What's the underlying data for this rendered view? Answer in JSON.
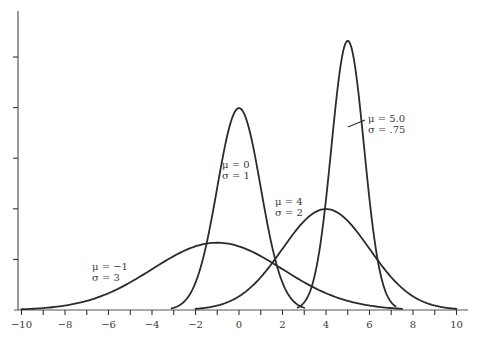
{
  "chart_data": {
    "type": "line",
    "title": "",
    "xlabel": "",
    "ylabel": "",
    "xlim": [
      -10,
      10
    ],
    "ylim": [
      0,
      0.55
    ],
    "grid": false,
    "legend": null,
    "x_ticks": [
      -10,
      -9,
      -8,
      -7,
      -6,
      -5,
      -4,
      -3,
      -2,
      -1,
      0,
      1,
      2,
      3,
      4,
      5,
      6,
      7,
      8,
      9,
      10
    ],
    "x_tick_labels": [
      "−10",
      "−8",
      "−6",
      "−4",
      "−2",
      "0",
      "2",
      "4",
      "6",
      "8",
      "10"
    ],
    "x_tick_label_values": [
      -10,
      -8,
      -6,
      -4,
      -2,
      0,
      2,
      4,
      6,
      8,
      10
    ],
    "y_ticks": [
      0.1,
      0.2,
      0.3,
      0.4,
      0.5
    ],
    "y_tick_labels": [],
    "series": [
      {
        "name": "μ = −1, σ = 3",
        "mu": -1,
        "sigma": 3,
        "x_range": [
          -10,
          7.5
        ],
        "peak": 0.133
      },
      {
        "name": "μ = 0, σ = 1",
        "mu": 0,
        "sigma": 1,
        "x_range": [
          -3.1,
          3.0
        ],
        "peak": 0.399
      },
      {
        "name": "μ = 4, σ = 2",
        "mu": 4,
        "sigma": 2,
        "x_range": [
          -2.0,
          10
        ],
        "peak": 0.199
      },
      {
        "name": "μ = 5.0, σ = .75",
        "mu": 5,
        "sigma": 0.75,
        "x_range": [
          2.7,
          7.2
        ],
        "peak": 0.532
      }
    ],
    "annotations": [
      {
        "line1": "μ = −1",
        "line2": "σ = 3",
        "x": 92,
        "y": 270
      },
      {
        "line1": "μ = 0",
        "line2": "σ = 1",
        "x": 222,
        "y": 168
      },
      {
        "line1": "μ = 4",
        "line2": "σ = 2",
        "x": 275,
        "y": 205
      },
      {
        "line1": "μ = 5.0",
        "line2": "σ = .75",
        "x": 368,
        "y": 122
      }
    ]
  },
  "colors": {
    "curve": "#2b2b2b",
    "axis": "#555555",
    "text": "#3a3a3a",
    "background": "#ffffff"
  }
}
